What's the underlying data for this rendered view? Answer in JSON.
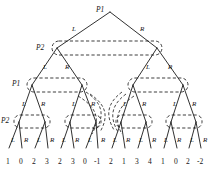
{
  "figure": {
    "type": "extensive-form-game-tree",
    "levels": 4,
    "leaf_count": 16,
    "edge_color": "#1a1a1a",
    "infoset_color": "#1a1a1a",
    "background": "#ffffff"
  },
  "players": {
    "p1": "P1",
    "p2": "P2"
  },
  "player_markers": [
    {
      "text": "P1",
      "x": 96,
      "y": 6,
      "name": "player-label-root-p1"
    },
    {
      "text": "P2",
      "x": 36,
      "y": 44,
      "name": "player-label-level2-p2"
    },
    {
      "text": "P1",
      "x": 12,
      "y": 80,
      "name": "player-label-level3-p1"
    },
    {
      "text": "P2",
      "x": 1,
      "y": 117,
      "name": "player-label-level4-p2"
    }
  ],
  "branch_labels": [
    {
      "text": "L",
      "x": 72,
      "y": 26
    },
    {
      "text": "R",
      "x": 140,
      "y": 26
    },
    {
      "text": "L",
      "x": 43,
      "y": 64
    },
    {
      "text": "R",
      "x": 65,
      "y": 64
    },
    {
      "text": "L",
      "x": 146,
      "y": 64
    },
    {
      "text": "R",
      "x": 168,
      "y": 64
    },
    {
      "text": "L",
      "x": 22,
      "y": 101
    },
    {
      "text": "R",
      "x": 41,
      "y": 101
    },
    {
      "text": "L",
      "x": 72,
      "y": 101
    },
    {
      "text": "R",
      "x": 91,
      "y": 101
    },
    {
      "text": "L",
      "x": 123,
      "y": 101
    },
    {
      "text": "R",
      "x": 142,
      "y": 101
    },
    {
      "text": "L",
      "x": 173,
      "y": 101
    },
    {
      "text": "R",
      "x": 192,
      "y": 101
    },
    {
      "text": "L",
      "x": 11,
      "y": 137
    },
    {
      "text": "R",
      "x": 24,
      "y": 137
    },
    {
      "text": "L",
      "x": 37,
      "y": 137
    },
    {
      "text": "R",
      "x": 50,
      "y": 137
    },
    {
      "text": "L",
      "x": 62,
      "y": 137
    },
    {
      "text": "R",
      "x": 75,
      "y": 137
    },
    {
      "text": "L",
      "x": 88,
      "y": 137
    },
    {
      "text": "R",
      "x": 101,
      "y": 137
    },
    {
      "text": "L",
      "x": 113,
      "y": 137
    },
    {
      "text": "R",
      "x": 126,
      "y": 137
    },
    {
      "text": "L",
      "x": 139,
      "y": 137
    },
    {
      "text": "R",
      "x": 152,
      "y": 137
    },
    {
      "text": "L",
      "x": 164,
      "y": 137
    },
    {
      "text": "R",
      "x": 177,
      "y": 137
    },
    {
      "text": "L",
      "x": 190,
      "y": 137
    },
    {
      "text": "R",
      "x": 203,
      "y": 137
    }
  ],
  "leaf_payoffs": [
    {
      "value": "1",
      "x": 9
    },
    {
      "value": "0",
      "x": 22
    },
    {
      "value": "2",
      "x": 35
    },
    {
      "value": "3",
      "x": 48
    },
    {
      "value": "2",
      "x": 61
    },
    {
      "value": "3",
      "x": 74
    },
    {
      "value": "0",
      "x": 86
    },
    {
      "value": "-1",
      "x": 97
    },
    {
      "value": "2",
      "x": 112
    },
    {
      "value": "1",
      "x": 125
    },
    {
      "value": "3",
      "x": 138
    },
    {
      "value": "4",
      "x": 151
    },
    {
      "value": "1",
      "x": 164
    },
    {
      "value": "0",
      "x": 177
    },
    {
      "value": "2",
      "x": 189
    },
    {
      "value": "-2",
      "x": 200
    }
  ],
  "leaf_row_y": 158,
  "nodes": {
    "root": [
      {
        "x": 110,
        "y": 12
      }
    ],
    "level2": [
      {
        "x": 57,
        "y": 48
      },
      {
        "x": 157,
        "y": 48
      }
    ],
    "level3": [
      {
        "x": 32,
        "y": 85
      },
      {
        "x": 82,
        "y": 85
      },
      {
        "x": 133,
        "y": 85
      },
      {
        "x": 183,
        "y": 85
      }
    ],
    "level4": [
      {
        "x": 19,
        "y": 122
      },
      {
        "x": 45,
        "y": 122
      },
      {
        "x": 70,
        "y": 122
      },
      {
        "x": 96,
        "y": 122
      },
      {
        "x": 121,
        "y": 122
      },
      {
        "x": 146,
        "y": 122
      },
      {
        "x": 171,
        "y": 122
      },
      {
        "x": 196,
        "y": 122
      }
    ],
    "leaves": [
      {
        "x": 9
      },
      {
        "x": 22
      },
      {
        "x": 35
      },
      {
        "x": 48
      },
      {
        "x": 61
      },
      {
        "x": 74
      },
      {
        "x": 86
      },
      {
        "x": 98
      },
      {
        "x": 112
      },
      {
        "x": 125
      },
      {
        "x": 138
      },
      {
        "x": 151
      },
      {
        "x": 164
      },
      {
        "x": 177
      },
      {
        "x": 189
      },
      {
        "x": 201
      }
    ],
    "leaf_y": 148
  },
  "information_sets": [
    {
      "name": "infoset-level2",
      "x": 52,
      "y": 41,
      "w": 110,
      "h": 14,
      "rx": 7
    },
    {
      "name": "infoset-level3-left",
      "x": 27,
      "y": 78,
      "w": 60,
      "h": 14,
      "rx": 7
    },
    {
      "name": "infoset-level3-right",
      "x": 128,
      "y": 78,
      "w": 60,
      "h": 14,
      "rx": 7
    },
    {
      "name": "infoset-level4-1",
      "x": 14,
      "y": 115,
      "w": 36,
      "h": 13,
      "rx": 6
    },
    {
      "name": "infoset-level4-2",
      "x": 65,
      "y": 115,
      "w": 36,
      "h": 13,
      "rx": 6
    },
    {
      "name": "infoset-level4-3",
      "x": 116,
      "y": 115,
      "w": 36,
      "h": 13,
      "rx": 6
    },
    {
      "name": "infoset-level4-4",
      "x": 166,
      "y": 115,
      "w": 36,
      "h": 13,
      "rx": 6
    }
  ]
}
